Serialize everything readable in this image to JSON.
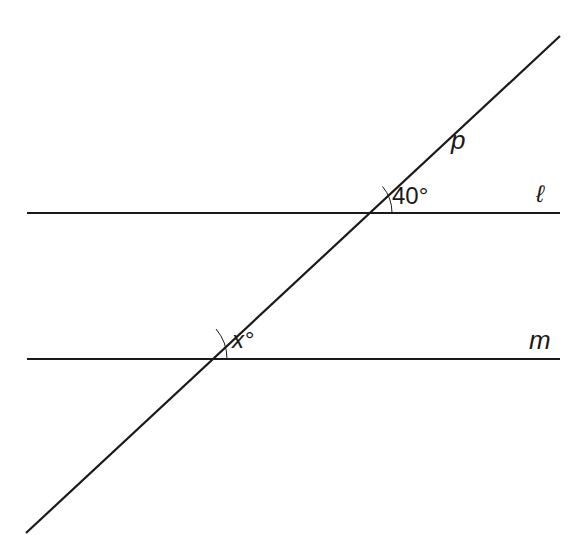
{
  "diagram": {
    "type": "parallel-lines-transversal",
    "colors": {
      "background": "#ffffff",
      "stroke": "#1a1a1a"
    },
    "lines": {
      "l": {
        "label": "ℓ",
        "x1": 27,
        "y1": 213,
        "x2": 560,
        "y2": 213
      },
      "m": {
        "label": "m",
        "x1": 27,
        "y1": 359,
        "x2": 560,
        "y2": 359
      },
      "p": {
        "label": "p",
        "x1": 26,
        "y1": 533,
        "x2": 560,
        "y2": 36
      }
    },
    "angles": {
      "upper": {
        "label": "40°",
        "vertex": [
          351,
          213
        ]
      },
      "lower": {
        "label": "x°",
        "vertex": [
          181,
          359
        ]
      }
    }
  }
}
